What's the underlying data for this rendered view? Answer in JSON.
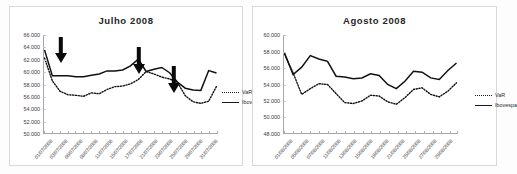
{
  "figure": {
    "charts": [
      {
        "id": "julho",
        "title": "Julho  2008",
        "legend": {
          "var_label": "VaR",
          "ibovespa_label": "Ibovespa"
        },
        "yticks": [
          "66.000",
          "64.000",
          "62.000",
          "60.000",
          "58.000",
          "56.000",
          "54.000",
          "52.000",
          "50.000"
        ],
        "xticklabels": [
          "01/07/2008",
          "03/07/2008",
          "06/07/2008",
          "08/07/2008",
          "11/07/2008",
          "15/07/2008",
          "17/07/2008",
          "21/07/2008",
          "23/07/2008",
          "25/07/2008",
          "29/07/2008",
          "31/07/2008"
        ],
        "annotations": [
          "arrow-1",
          "arrow-2",
          "arrow-3"
        ]
      },
      {
        "id": "agosto",
        "title": "Agosto  2008",
        "legend": {
          "var_label": "VaR",
          "ibovespa_label": "Ibovespa"
        },
        "yticks": [
          "60.000",
          "58.000",
          "56.000",
          "54.000",
          "52.000",
          "50.000",
          "48.000"
        ],
        "xticklabels": [
          "01/08/2008",
          "05/08/2008",
          "07/08/2008",
          "11/08/2008",
          "13/08/2008",
          "15/08/2008",
          "19/08/2008",
          "21/08/2008",
          "25/08/2008",
          "27/08/2008",
          "29/08/2008"
        ],
        "annotations": []
      }
    ]
  },
  "chart_data": [
    {
      "type": "line",
      "title": "Julho  2008",
      "xlabel": "",
      "ylabel": "",
      "ylim": [
        50000,
        66000
      ],
      "ytick_values": [
        50000,
        52000,
        54000,
        56000,
        58000,
        60000,
        62000,
        64000,
        66000
      ],
      "grid": true,
      "legend_position": "right",
      "x": [
        "01/07/2008",
        "02/07/2008",
        "03/07/2008",
        "04/07/2008",
        "07/07/2008",
        "08/07/2008",
        "09/07/2008",
        "10/07/2008",
        "11/07/2008",
        "14/07/2008",
        "15/07/2008",
        "16/07/2008",
        "17/07/2008",
        "18/07/2008",
        "21/07/2008",
        "22/07/2008",
        "23/07/2008",
        "24/07/2008",
        "25/07/2008",
        "28/07/2008",
        "29/07/2008",
        "30/07/2008",
        "31/07/2008"
      ],
      "series": [
        {
          "name": "Ibovespa",
          "style": "solid",
          "values": [
            63600,
            59400,
            59400,
            59400,
            59250,
            59250,
            59500,
            59700,
            60200,
            60200,
            60350,
            61000,
            62100,
            60100,
            60450,
            60750,
            59900,
            58400,
            57400,
            57100,
            57050,
            60250,
            59850
          ]
        },
        {
          "name": "VaR",
          "style": "dotted",
          "values": [
            62300,
            58600,
            56900,
            56350,
            56250,
            56100,
            56650,
            56500,
            57200,
            57650,
            57750,
            58100,
            58800,
            60100,
            59700,
            59200,
            58900,
            58350,
            56200,
            55200,
            54950,
            55300,
            57700
          ]
        }
      ],
      "annotations": [
        {
          "type": "arrow",
          "direction": "down",
          "near_x": "01/07/2008",
          "label": ""
        },
        {
          "type": "arrow",
          "direction": "down",
          "near_x": "18/07/2008",
          "label": ""
        },
        {
          "type": "arrow",
          "direction": "down",
          "near_x": "24/07/2008",
          "label": ""
        }
      ]
    },
    {
      "type": "line",
      "title": "Agosto  2008",
      "xlabel": "",
      "ylabel": "",
      "ylim": [
        48000,
        60000
      ],
      "ytick_values": [
        48000,
        50000,
        52000,
        54000,
        56000,
        58000,
        60000
      ],
      "grid": true,
      "legend_position": "right",
      "x": [
        "01/08/2008",
        "04/08/2008",
        "05/08/2008",
        "06/08/2008",
        "07/08/2008",
        "08/08/2008",
        "11/08/2008",
        "12/08/2008",
        "13/08/2008",
        "14/08/2008",
        "15/08/2008",
        "18/08/2008",
        "19/08/2008",
        "20/08/2008",
        "21/08/2008",
        "22/08/2008",
        "25/08/2008",
        "26/08/2008",
        "27/08/2008",
        "28/08/2008",
        "29/08/2008"
      ],
      "series": [
        {
          "name": "Ibovespa",
          "style": "solid",
          "values": [
            57800,
            55200,
            56100,
            57500,
            57100,
            56800,
            55000,
            54900,
            54700,
            54800,
            55300,
            55100,
            54000,
            53500,
            54400,
            55600,
            55500,
            54800,
            54600,
            55700,
            56600
          ]
        },
        {
          "name": "VaR",
          "style": "dotted",
          "values": [
            57700,
            55400,
            52800,
            53500,
            54100,
            54000,
            52900,
            51800,
            51700,
            52000,
            52700,
            52600,
            51900,
            51600,
            52400,
            53400,
            53600,
            52800,
            52500,
            53200,
            54200
          ]
        }
      ],
      "annotations": []
    }
  ]
}
